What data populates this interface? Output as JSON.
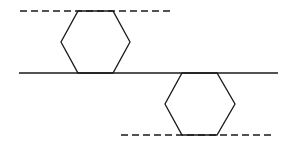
{
  "diagram": {
    "stroke_color": "#1a1a1a",
    "solid_line": {
      "x1": 19,
      "y1": 73,
      "x2": 278,
      "y2": 73
    },
    "top_dashed_line": {
      "x1": 20,
      "y1": 11,
      "x2": 172,
      "y2": 11
    },
    "bottom_dashed_line": {
      "x1": 121,
      "y1": 135,
      "x2": 273,
      "y2": 135
    },
    "top_hexagon": {
      "points": "78,11 113,11 130,42 113,73 78,73 61,42"
    },
    "bottom_hexagon": {
      "points": "182,73 217,73 235,104 217,135 182,135 165,104"
    }
  }
}
